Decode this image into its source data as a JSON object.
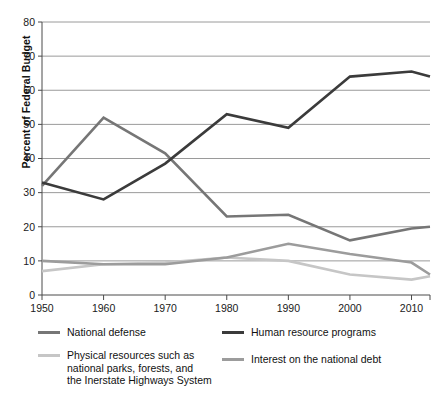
{
  "chart_data": {
    "type": "line",
    "title": "",
    "subtitle": "",
    "xlabel": "",
    "ylabel": "Percent of Federal Budget",
    "xlim": [
      1950,
      2013
    ],
    "ylim": [
      0,
      80
    ],
    "grid": true,
    "legend_position": "bottom",
    "x": [
      1950,
      1960,
      1970,
      1980,
      1990,
      2000,
      2010,
      2013
    ],
    "xticks": [
      "1950",
      "1960",
      "1970",
      "1980",
      "1990",
      "2000",
      "2010"
    ],
    "xtick_values": [
      1950,
      1960,
      1970,
      1980,
      1990,
      2000,
      2010
    ],
    "yticks": [
      "0",
      "10",
      "20",
      "30",
      "40",
      "50",
      "60",
      "70",
      "80"
    ],
    "ytick_values": [
      0,
      10,
      20,
      30,
      40,
      50,
      60,
      70,
      80
    ],
    "series": [
      {
        "name": "National defense",
        "color": "#767676",
        "width": 2.6,
        "values": [
          32,
          52,
          41.5,
          23,
          23.5,
          16,
          19.5,
          20
        ]
      },
      {
        "name": "Human resource programs",
        "color": "#3b3b3b",
        "width": 2.6,
        "values": [
          33,
          28,
          38.5,
          53,
          49,
          64,
          65.5,
          64
        ]
      },
      {
        "name": "Physical resources such as\nnational parks, forests, and\nthe Inerstate Highways System",
        "color": "#c6c6c6",
        "width": 2.6,
        "values": [
          7,
          9,
          9.5,
          11,
          10,
          6,
          4.5,
          5.5
        ]
      },
      {
        "name": "Interest on the national debt",
        "color": "#9c9c9c",
        "width": 2.6,
        "values": [
          10,
          9,
          9,
          11,
          15,
          12,
          9.5,
          6
        ]
      }
    ]
  },
  "axes": {
    "y_title": "Percent of Federal Budget",
    "y_labels": [
      "80",
      "70",
      "60",
      "50",
      "40",
      "30",
      "20",
      "10",
      "0"
    ],
    "x_labels": [
      "1950",
      "1960",
      "1970",
      "1980",
      "1990",
      "2000",
      "2010"
    ]
  },
  "legend": {
    "entries": [
      {
        "label": "National defense",
        "color": "#767676"
      },
      {
        "label": "Human resource programs",
        "color": "#3b3b3b"
      },
      {
        "label": "Physical resources such as\nnational parks, forests, and\nthe Inerstate Highways System",
        "color": "#c6c6c6"
      },
      {
        "label": "Interest on the national debt",
        "color": "#9c9c9c"
      }
    ]
  }
}
